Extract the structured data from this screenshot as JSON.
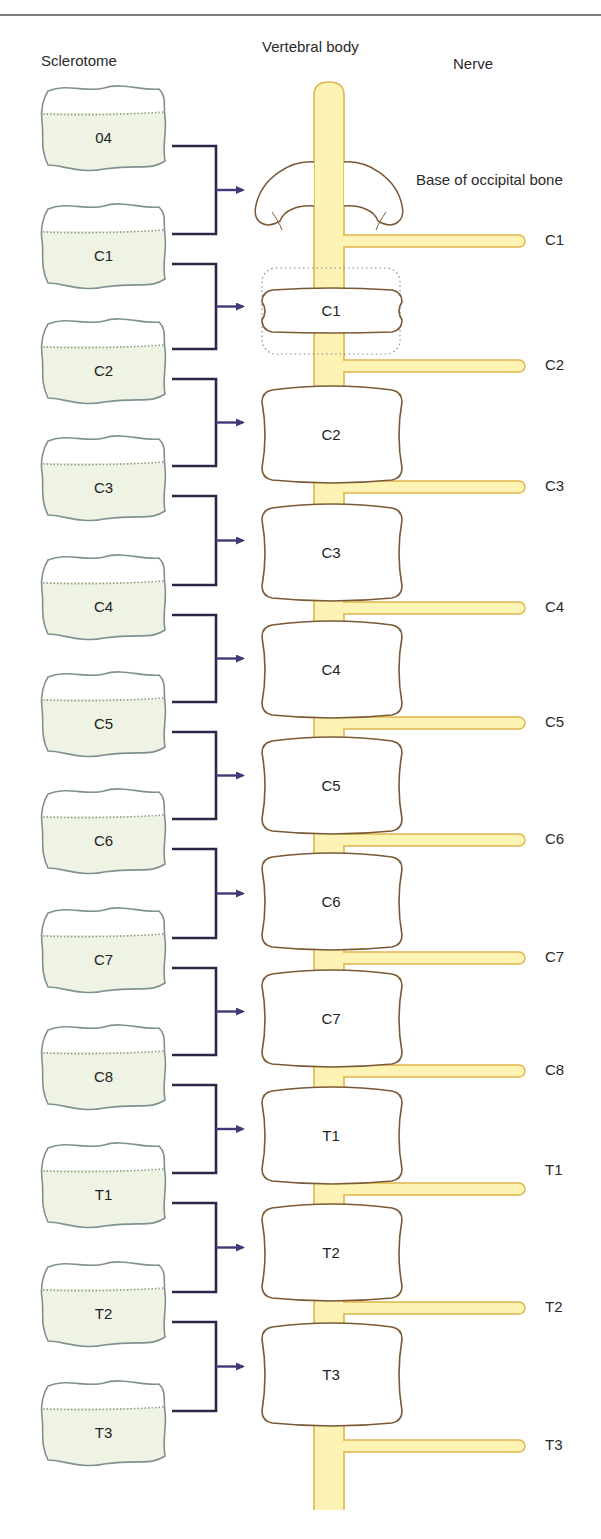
{
  "figure": {
    "headers": {
      "sclerotome": "Sclerotome",
      "vertebral_body": "Vertebral body",
      "nerve": "Nerve"
    },
    "occipital_label": "Base of occipital bone",
    "sclerotomes": [
      "04",
      "C1",
      "C2",
      "C3",
      "C4",
      "C5",
      "C6",
      "C7",
      "C8",
      "T1",
      "T2",
      "T3"
    ],
    "vertebrae": [
      "C1",
      "C2",
      "C3",
      "C4",
      "C5",
      "C6",
      "C7",
      "T1",
      "T2",
      "T3"
    ],
    "nerves": [
      "C1",
      "C2",
      "C3",
      "C4",
      "C5",
      "C6",
      "C7",
      "C8",
      "T1",
      "T2",
      "T3"
    ],
    "colors": {
      "sclerotome_fill": "#eef3e4",
      "sclerotome_stroke": "#7f9190",
      "dotted_line": "#8aa080",
      "spinal_cord_fill": "#fdf3b5",
      "spinal_cord_stroke": "#e0b64a",
      "vertebra_stroke": "#7a5a35",
      "bracket": "#2e2647",
      "arrow": "#3e3a78"
    }
  }
}
